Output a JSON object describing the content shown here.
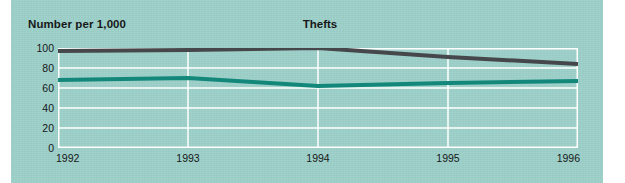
{
  "panel": {
    "background_color": "#9ccfc8"
  },
  "chart_data": {
    "type": "line",
    "title": "Thefts",
    "ylabel": "Number per 1,000",
    "xlabel": "",
    "x": [
      1992,
      1993,
      1994,
      1995,
      1996
    ],
    "xtick_labels": [
      "1992",
      "1993",
      "1994",
      "1995",
      "1996"
    ],
    "ytick_labels": [
      "0",
      "20",
      "40",
      "60",
      "80",
      "100"
    ],
    "yticks": [
      0,
      20,
      40,
      60,
      80,
      100
    ],
    "ylim": [
      0,
      100
    ],
    "xlim": [
      1992,
      1996
    ],
    "grid": "both",
    "grid_color": "#ffffff",
    "legend": "none",
    "series": [
      {
        "name": "series-dark",
        "color": "#46474a",
        "values": [
          97,
          98,
          100,
          91,
          84
        ]
      },
      {
        "name": "series-teal",
        "color": "#13887a",
        "values": [
          68,
          70,
          62,
          65,
          67
        ]
      }
    ]
  }
}
